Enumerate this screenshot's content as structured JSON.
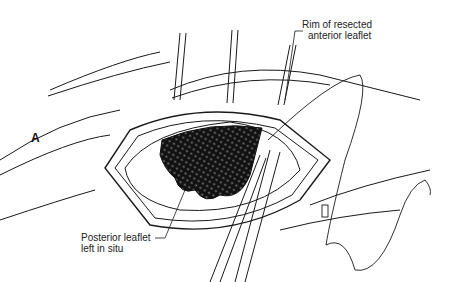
{
  "figure": {
    "panel_label": "A",
    "labels": [
      {
        "id": "rim",
        "lines": [
          "Rim of resected",
          "anterior leaflet"
        ]
      },
      {
        "id": "posterior",
        "lines": [
          "Posterior leaflet",
          "left in situ"
        ]
      }
    ]
  },
  "colors": {
    "ink": "#1a1a1a",
    "background": "#ffffff"
  }
}
